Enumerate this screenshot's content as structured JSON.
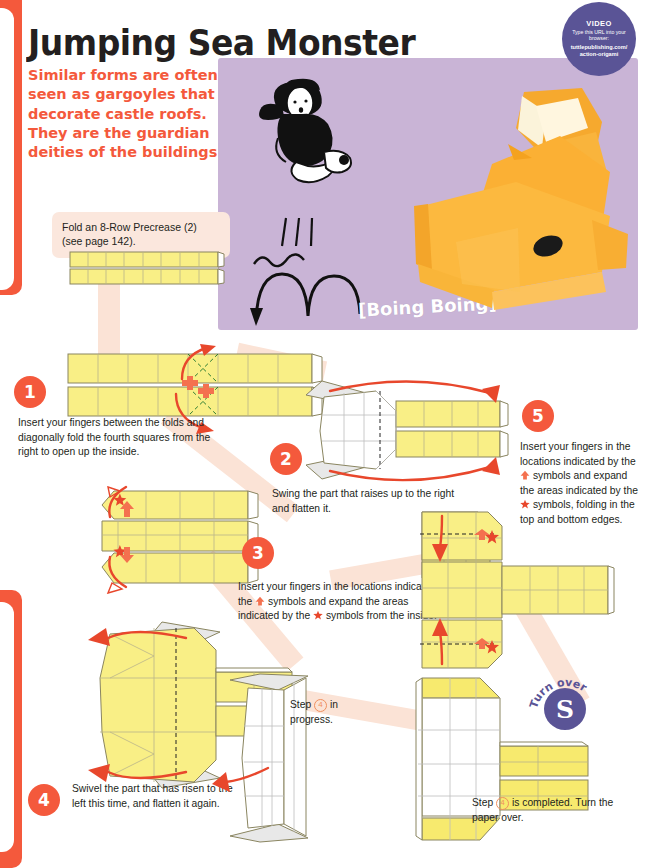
{
  "page": {
    "title": "Jumping Sea Monster",
    "blurb": "Similar forms are often seen as gargoyles that decorate castle roofs. They are the guardian deities of the buildings!",
    "accent_color": "#f4593c",
    "photo_bg_color": "#c9b4d6",
    "badge_color": "#5a5496"
  },
  "video_badge": {
    "label": "VIDEO",
    "subtitle": "Type this URL into your browser:",
    "url_line1": "tuttlepublishing.com/",
    "url_line2": "action-origami"
  },
  "photo": {
    "sound_effect": "[Boing Boing]"
  },
  "callout": {
    "text": "Fold an 8-Row Precrease (2) (see page 142)."
  },
  "steps": [
    {
      "number": "1",
      "text": "Insert your fingers between the folds and diagonally fold the fourth squares from the right to open up the inside."
    },
    {
      "number": "2",
      "text": "Swing the part that raises up to the right and flatten it."
    },
    {
      "number": "3",
      "text_a": "Insert your fingers in the locations indicated by the",
      "text_b": "symbols and expand the areas indicated by the",
      "text_c": "symbols from the inside."
    },
    {
      "number": "4",
      "text": "Swivel the part that has risen to the left this time, and flatten it again."
    },
    {
      "number": "5",
      "text_a": "Insert your fingers in the locations indicated by the",
      "text_b": "symbols and expand the areas indicated by the",
      "text_c": "symbols, folding in the top and bottom edges."
    }
  ],
  "notes": {
    "in_progress_a": "Step",
    "in_progress_num": "4",
    "in_progress_b": "in progress.",
    "completed_a": "Step",
    "completed_num": "4",
    "completed_b": "is completed. Turn the paper over."
  },
  "turn_over": {
    "label": "Turn over",
    "glyph": "S"
  }
}
